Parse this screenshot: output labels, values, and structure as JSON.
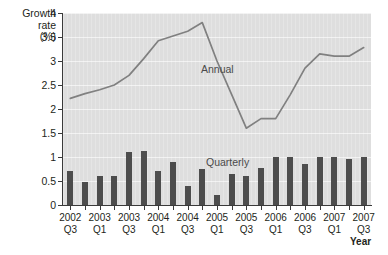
{
  "axis_title": {
    "line1": "Growth",
    "line2": "rate",
    "line3": "(%)"
  },
  "x_axis_caption": "Year",
  "series_labels": {
    "annual": "Annual",
    "quarterly": "Quarterly"
  },
  "chart_data": {
    "type": "line",
    "title": "",
    "subtitle": "",
    "xlabel": "Year",
    "ylabel": "Growth rate (%)",
    "ylim": [
      0,
      4
    ],
    "yticks": [
      0,
      0.5,
      1,
      1.5,
      2,
      2.5,
      3,
      3.5,
      4
    ],
    "ytick_labels": [
      "0",
      "0.5",
      "1",
      "1.5",
      "2",
      "2.5",
      "3",
      "3.5",
      "4"
    ],
    "grid": true,
    "legend": "inline-annotations",
    "categories": [
      "2002 Q3",
      "2002 Q4",
      "2003 Q1",
      "2003 Q2",
      "2003 Q3",
      "2003 Q4",
      "2004 Q1",
      "2004 Q2",
      "2004 Q3",
      "2004 Q4",
      "2005 Q1",
      "2005 Q2",
      "2005 Q3",
      "2005 Q4",
      "2006 Q1",
      "2006 Q2",
      "2006 Q3",
      "2006 Q4",
      "2007 Q1",
      "2007 Q2",
      "2007 Q3"
    ],
    "xtick_labels": [
      {
        "index": 0,
        "year": "2002",
        "quarter": "Q3"
      },
      {
        "index": 2,
        "year": "2003",
        "quarter": "Q1"
      },
      {
        "index": 4,
        "year": "2003",
        "quarter": "Q3"
      },
      {
        "index": 6,
        "year": "2004",
        "quarter": "Q1"
      },
      {
        "index": 8,
        "year": "2004",
        "quarter": "Q3"
      },
      {
        "index": 10,
        "year": "2005",
        "quarter": "Q1"
      },
      {
        "index": 12,
        "year": "2005",
        "quarter": "Q3"
      },
      {
        "index": 14,
        "year": "2006",
        "quarter": "Q1"
      },
      {
        "index": 16,
        "year": "2006",
        "quarter": "Q3"
      },
      {
        "index": 18,
        "year": "2007",
        "quarter": "Q1"
      },
      {
        "index": 20,
        "year": "2007",
        "quarter": "Q3"
      }
    ],
    "series": [
      {
        "name": "Quarterly",
        "type": "bar",
        "color": "#4d4d4d",
        "values": [
          0.7,
          0.48,
          0.6,
          0.6,
          1.1,
          1.12,
          0.7,
          0.9,
          0.4,
          0.75,
          0.2,
          0.65,
          0.6,
          0.78,
          1.0,
          1.0,
          0.85,
          1.0,
          1.0,
          0.95,
          1.0
        ]
      },
      {
        "name": "Annual",
        "type": "line",
        "color": "#808080",
        "values": [
          2.22,
          2.32,
          2.4,
          2.5,
          2.7,
          3.05,
          3.42,
          3.52,
          3.62,
          3.8,
          3.0,
          2.3,
          1.6,
          1.8,
          1.8,
          2.3,
          2.85,
          3.15,
          3.1,
          3.1,
          3.28
        ]
      }
    ]
  },
  "colors": {
    "plot_background": "#dedede",
    "gridline": "#f2f2f2",
    "axis": "#3a3a3a",
    "bar": "#4d4d4d",
    "line": "#808080",
    "text": "#231f20"
  }
}
